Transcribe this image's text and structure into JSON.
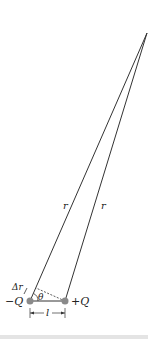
{
  "diagram": {
    "labels": {
      "r_left": "r",
      "r_right": "r",
      "delta_r": "Δr",
      "theta": "θ",
      "neg_charge": "−Q",
      "pos_charge": "+Q",
      "separation": "l"
    },
    "colors": {
      "line": "#333333",
      "charge": "#8a8a8a"
    }
  }
}
